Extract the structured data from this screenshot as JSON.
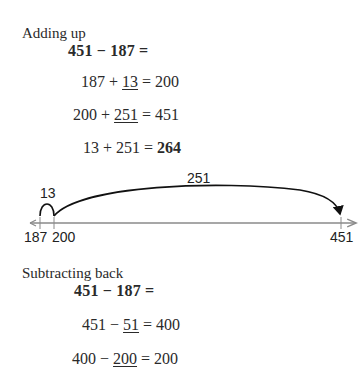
{
  "adding_up": {
    "heading": "Adding up",
    "problem": "451 − 187 =",
    "steps": [
      {
        "a": "187",
        "op": "+",
        "b": "13",
        "eq": "=",
        "result": "200"
      },
      {
        "a": "200",
        "op": "+",
        "b": "251",
        "eq": "=",
        "result": "451"
      },
      {
        "a": "13",
        "op": "+",
        "b": "251",
        "eq": "=",
        "result": "264"
      }
    ]
  },
  "number_line": {
    "ticks": [
      "187",
      "200",
      "451"
    ],
    "jumps": [
      {
        "label": "13",
        "from": "187",
        "to": "200"
      },
      {
        "label": "251",
        "from": "200",
        "to": "451"
      }
    ]
  },
  "subtracting_back": {
    "heading": "Subtracting back",
    "problem": "451 − 187 =",
    "steps": [
      {
        "a": "451",
        "op": "−",
        "b": "51",
        "eq": "=",
        "result": "400"
      },
      {
        "a": "400",
        "op": "−",
        "b": "200",
        "eq": "=",
        "result": "200"
      }
    ]
  },
  "colors": {
    "text": "#2a2a2a",
    "axis": "#8a8a8a",
    "arc": "#111111"
  }
}
